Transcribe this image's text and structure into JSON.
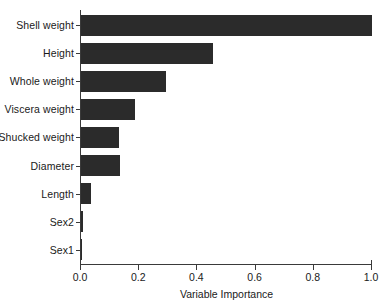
{
  "chart_data": {
    "type": "bar",
    "orientation": "horizontal",
    "title": "",
    "xlabel": "Variable Importance",
    "ylabel": "",
    "xlim": [
      0.0,
      1.0
    ],
    "xticks": [
      "0.0",
      "0.2",
      "0.4",
      "0.6",
      "0.8",
      "1.0"
    ],
    "xtick_values": [
      0.0,
      0.2,
      0.4,
      0.6,
      0.8,
      1.0
    ],
    "grid": false,
    "legend": null,
    "bar_color": "#2b2b2b",
    "axis_color": "#3a3a3a",
    "background_color": "#ffffff",
    "categories": [
      "Shell weight",
      "Height",
      "Whole weight",
      "Viscera weight",
      "Shucked weight",
      "Diameter",
      "Length",
      "Sex2",
      "Sex1"
    ],
    "values": [
      1.0,
      0.452,
      0.291,
      0.185,
      0.131,
      0.134,
      0.035,
      0.007,
      0.002
    ]
  }
}
